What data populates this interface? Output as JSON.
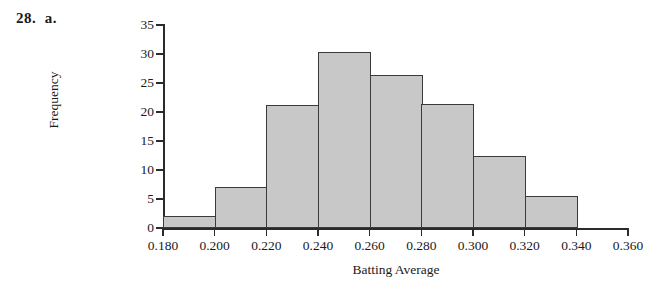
{
  "problem": {
    "label": "28.  a."
  },
  "chart_data": {
    "type": "bar",
    "title": "",
    "xlabel": "Batting Average",
    "ylabel": "Frequency",
    "xlim": [
      0.18,
      0.36
    ],
    "ylim": [
      0,
      35
    ],
    "grid": false,
    "legend": null,
    "bin_width": 0.02,
    "bin_edges": [
      0.18,
      0.2,
      0.22,
      0.24,
      0.26,
      0.28,
      0.3,
      0.32,
      0.34
    ],
    "categories": [
      "0.180-0.200",
      "0.200-0.220",
      "0.220-0.240",
      "0.240-0.260",
      "0.260-0.280",
      "0.280-0.300",
      "0.300-0.320",
      "0.320-0.340"
    ],
    "values": [
      2.1,
      7.1,
      21.2,
      30.3,
      26.3,
      21.3,
      12.4,
      5.6
    ],
    "x_ticks": [
      "0.180",
      "0.200",
      "0.220",
      "0.240",
      "0.260",
      "0.280",
      "0.300",
      "0.320",
      "0.340",
      "0.360"
    ],
    "x_tick_values": [
      0.18,
      0.2,
      0.22,
      0.24,
      0.26,
      0.28,
      0.3,
      0.32,
      0.34,
      0.36
    ],
    "y_ticks": [
      "0",
      "5",
      "10",
      "15",
      "20",
      "25",
      "30",
      "35"
    ],
    "y_tick_values": [
      0,
      5,
      10,
      15,
      20,
      25,
      30,
      35
    ],
    "bar_fill_color": "#c8c8c8",
    "bar_edge_color": "#3a3a3a",
    "axis_color": "#2b2b2b",
    "background_color": "#ffffff"
  }
}
